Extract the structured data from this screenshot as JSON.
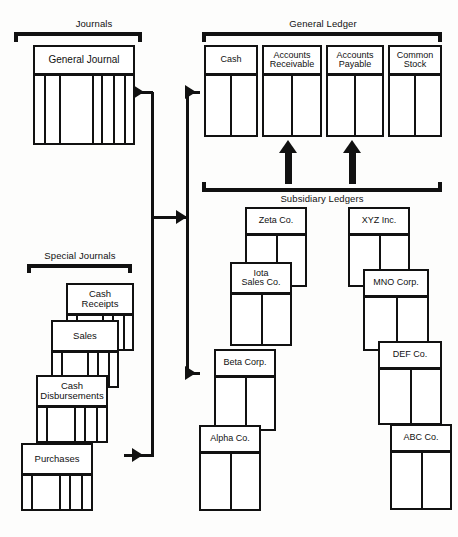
{
  "diagram": {
    "groups": {
      "journals": "Journals",
      "general_ledger": "General Ledger",
      "special_journals": "Special Journals",
      "subsidiary_ledgers": "Subsidiary Ledgers"
    }
  },
  "journals": {
    "general_journal": "General Journal"
  },
  "general_ledger": {
    "accounts": [
      {
        "name": "Cash",
        "line1": "Cash",
        "line2": ""
      },
      {
        "name": "Accounts Receivable",
        "line1": "Accounts",
        "line2": "Receivable"
      },
      {
        "name": "Accounts Payable",
        "line1": "Accounts",
        "line2": "Payable"
      },
      {
        "name": "Common Stock",
        "line1": "Common",
        "line2": "Stock"
      }
    ]
  },
  "special_journals": {
    "items": [
      {
        "name": "Cash Receipts",
        "line1": "Cash",
        "line2": "Receipts"
      },
      {
        "name": "Sales",
        "line1": "Sales",
        "line2": ""
      },
      {
        "name": "Cash Disbursements",
        "line1": "Cash",
        "line2": "Disbursements"
      },
      {
        "name": "Purchases",
        "line1": "Purchases",
        "line2": ""
      }
    ]
  },
  "subsidiary_ledgers": {
    "accounts_receivable_column": [
      {
        "name": "Zeta Co.",
        "line1": "Zeta Co.",
        "line2": ""
      },
      {
        "name": "Iota Sales Co.",
        "line1": "Iota",
        "line2": "Sales Co."
      },
      {
        "name": "Beta Corp.",
        "line1": "Beta Corp.",
        "line2": ""
      },
      {
        "name": "Alpha Co.",
        "line1": "Alpha Co.",
        "line2": ""
      }
    ],
    "accounts_payable_column": [
      {
        "name": "XYZ Inc.",
        "line1": "XYZ Inc.",
        "line2": ""
      },
      {
        "name": "MNO Corp.",
        "line1": "MNO Corp.",
        "line2": ""
      },
      {
        "name": "DEF Co.",
        "line1": "DEF Co.",
        "line2": ""
      },
      {
        "name": "ABC Co.",
        "line1": "ABC Co.",
        "line2": ""
      }
    ]
  },
  "colors": {
    "ink": "#111111",
    "paper": "#ffffff",
    "background": "#fdfdfc"
  }
}
